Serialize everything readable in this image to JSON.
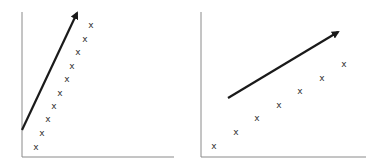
{
  "chart_data": [
    {
      "type": "scatter",
      "title": "",
      "xlabel": "",
      "ylabel": "",
      "marker": "x",
      "grid": false,
      "axes": {
        "origin": [
          22,
          157
        ],
        "y_top": 12,
        "x_right": 174
      },
      "points": [
        [
          36,
          147
        ],
        [
          42,
          133
        ],
        [
          48,
          119
        ],
        [
          54,
          106
        ],
        [
          60,
          93
        ],
        [
          67,
          79
        ],
        [
          72,
          66
        ],
        [
          78,
          52
        ],
        [
          85,
          39
        ],
        [
          91,
          25
        ]
      ],
      "arrow": {
        "from": [
          22,
          130
        ],
        "to": [
          77,
          13
        ],
        "color": "#1a1a1a"
      },
      "note": "Steep linear trend; arrow parallel to point cloud"
    },
    {
      "type": "scatter",
      "title": "",
      "xlabel": "",
      "ylabel": "",
      "marker": "x",
      "grid": false,
      "axes": {
        "origin": [
          201,
          157
        ],
        "y_top": 12,
        "x_right": 366
      },
      "points": [
        [
          214,
          146
        ],
        [
          236,
          132
        ],
        [
          257,
          118
        ],
        [
          279,
          105
        ],
        [
          300,
          91
        ],
        [
          322,
          78
        ],
        [
          344,
          64
        ]
      ],
      "arrow": {
        "from": [
          228,
          98
        ],
        "to": [
          338,
          32
        ],
        "color": "#1a1a1a"
      },
      "note": "Shallower linear trend; arrow parallel to point cloud"
    }
  ],
  "marker_glyph": "x",
  "colors": {
    "axis": "#8a8a8a",
    "arrow": "#1a1a1a",
    "marker": "#333333",
    "background": "#ffffff"
  }
}
